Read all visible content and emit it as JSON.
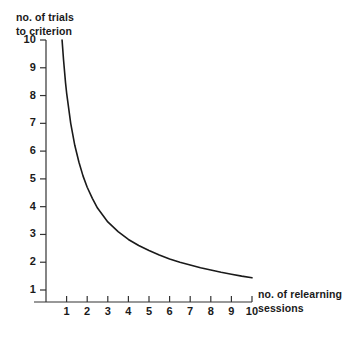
{
  "chart_data": {
    "type": "line",
    "title": "",
    "subtitle": "",
    "xlabel": "no. of relearning sessions",
    "ylabel": "no. of trials to criterion",
    "xlabel_lines": [
      "no. of relearning",
      "sessions"
    ],
    "ylabel_lines": [
      "no. of trials",
      "to criterion"
    ],
    "xlim": [
      0,
      10.6
    ],
    "ylim": [
      0.4,
      10.4
    ],
    "xticks": [
      1,
      2,
      3,
      4,
      5,
      6,
      7,
      8,
      9,
      10
    ],
    "yticks": [
      1,
      2,
      3,
      4,
      5,
      6,
      7,
      8,
      9,
      10
    ],
    "xticklabels": [
      "1",
      "2",
      "3",
      "4",
      "5",
      "6",
      "7",
      "8",
      "9",
      "10"
    ],
    "yticklabels": [
      "1",
      "2",
      "3",
      "4",
      "5",
      "6",
      "7",
      "8",
      "9",
      "10"
    ],
    "grid": false,
    "legend": false,
    "legend_position": "none",
    "line_color": "#1a1a1a",
    "line_width": 1.6,
    "axis_color": "#333333",
    "background": "#ffffff",
    "series": [
      {
        "name": "trials to criterion",
        "x": [
          0.78,
          0.85,
          0.95,
          1.0,
          1.2,
          1.4,
          1.6,
          1.8,
          2.0,
          2.25,
          2.5,
          2.75,
          3.0,
          3.5,
          4.0,
          4.5,
          5.0,
          5.5,
          6.0,
          6.5,
          7.0,
          7.5,
          8.0,
          8.5,
          9.0,
          9.5,
          10.0
        ],
        "values": [
          10.0,
          9.3,
          8.45,
          8.1,
          7.0,
          6.2,
          5.6,
          5.1,
          4.7,
          4.3,
          3.95,
          3.7,
          3.45,
          3.1,
          2.82,
          2.6,
          2.42,
          2.26,
          2.12,
          2.0,
          1.9,
          1.8,
          1.72,
          1.64,
          1.57,
          1.5,
          1.44
        ]
      }
    ],
    "annotations": []
  }
}
